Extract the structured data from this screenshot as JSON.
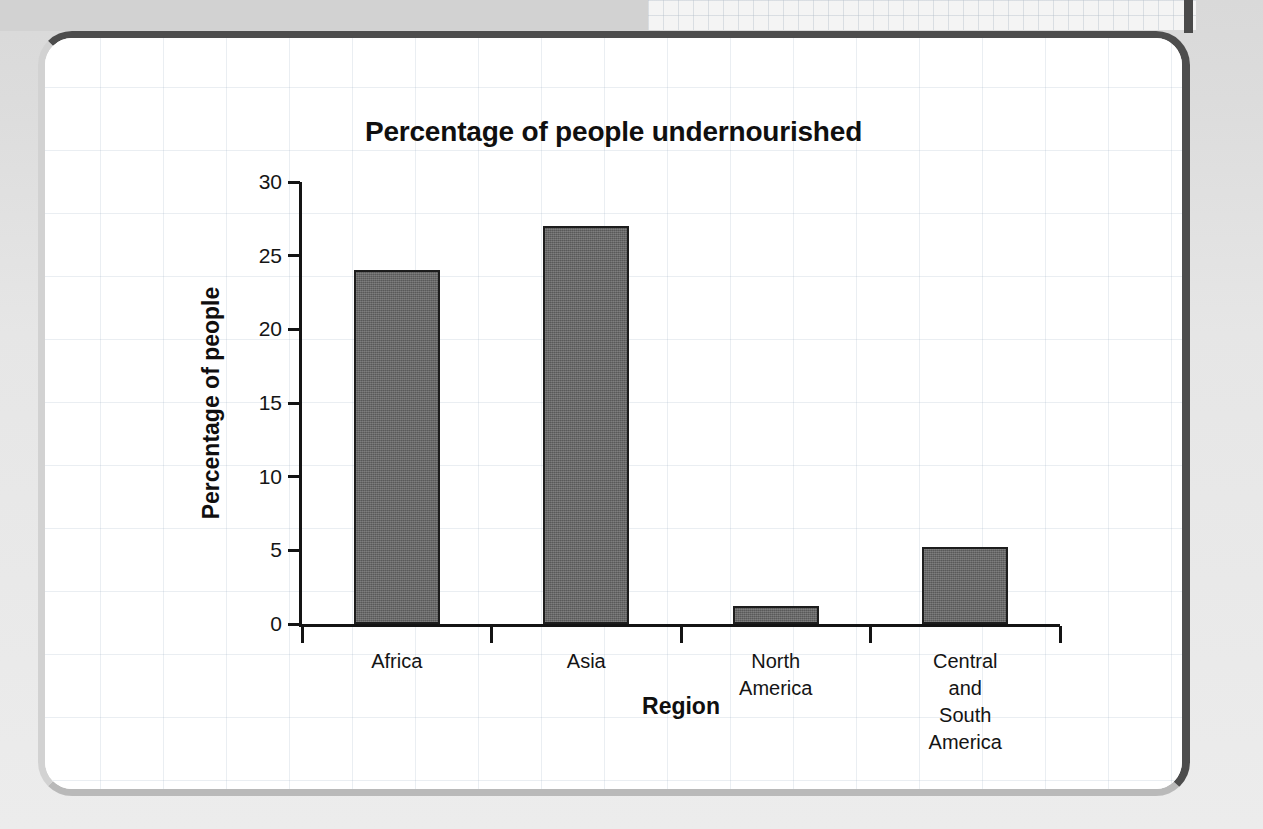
{
  "chart_data": {
    "type": "bar",
    "title": "Percentage of people undernourished",
    "xlabel": "Region",
    "ylabel": "Percentage of people",
    "categories": [
      "Africa",
      "Asia",
      "North\nAmerica",
      "Central and\nSouth America"
    ],
    "values": [
      24,
      27,
      1.2,
      5.2
    ],
    "ylim": [
      0,
      30
    ],
    "ytick_labels": [
      "0",
      "5",
      "10",
      "15",
      "20",
      "25",
      "30"
    ],
    "ytick_values": [
      0,
      5,
      10,
      15,
      20,
      25,
      30
    ],
    "grid": false,
    "legend": null,
    "bar_color": "#636363",
    "bar_edge_color": "#1d1d1d",
    "axis_color": "#141414",
    "text_color": "#100f0f"
  },
  "page": {
    "panel_border_color": "#4d4d4d",
    "background_color": "#e9e9e9"
  }
}
